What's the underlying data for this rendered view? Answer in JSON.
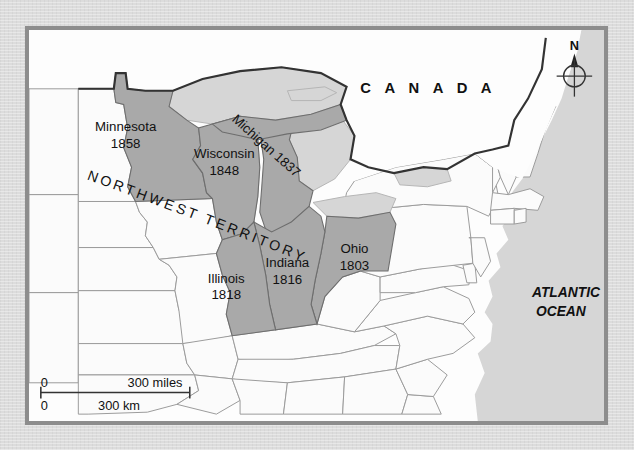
{
  "map": {
    "title_region": "Northwest Territory",
    "frame_color": "#8d8d8d",
    "colors": {
      "territory_fill": "#a9a9a9",
      "other_land_fill": "#fbfbfb",
      "water_fill": "#d6d6d6",
      "ocean_fill": "#d6d6d6",
      "border_line": "#9a9a9a",
      "national_border_line": "#3a3a3a",
      "label_text": "#1a1a1a",
      "page_background": "#dcdcdc"
    },
    "country_labels": [
      {
        "name": "canada",
        "text": "C A N A D A"
      }
    ],
    "ocean_labels": [
      {
        "name": "atlantic-ocean",
        "line1": "ATLANTIC",
        "line2": "OCEAN"
      }
    ],
    "territory_label": {
      "text": "N O R T H W E S T   T E R R I T O R Y",
      "plain": "NORTHWEST TERRITORY"
    },
    "states": [
      {
        "id": "minnesota",
        "name": "Minnesota",
        "year": "1858"
      },
      {
        "id": "wisconsin",
        "name": "Wisconsin",
        "year": "1848"
      },
      {
        "id": "michigan",
        "name": "Michigan",
        "year": "1837",
        "inline": "Michigan 1837"
      },
      {
        "id": "ohio",
        "name": "Ohio",
        "year": "1803"
      },
      {
        "id": "indiana",
        "name": "Indiana",
        "year": "1816"
      },
      {
        "id": "illinois",
        "name": "Illinois",
        "year": "1818"
      }
    ],
    "scale_bar": {
      "miles_zero": "0",
      "miles_value": "300 miles",
      "km_zero": "0",
      "km_value": "300 km"
    },
    "compass": {
      "north_label": "N"
    }
  }
}
